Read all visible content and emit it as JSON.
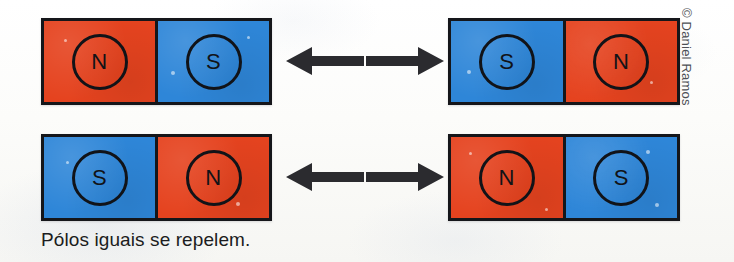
{
  "figure": {
    "caption": "Pólos iguais se repelem.",
    "credit": "© Daniel Ramos",
    "background_color": "#fbfbf9",
    "colors": {
      "north_pole": "#e5431f",
      "south_pole": "#2e86d8",
      "outline": "#15161a",
      "arrow": "#2b2b2f",
      "text": "#1b1c20",
      "credit_text": "#4c4f55"
    },
    "rows": [
      {
        "row_name": "top-pair",
        "left_magnet": {
          "name": "magnet-top-left",
          "poles": [
            {
              "label": "N",
              "type": "north",
              "icon": "north-pole-badge"
            },
            {
              "label": "S",
              "type": "south",
              "icon": "south-pole-badge"
            }
          ]
        },
        "left_arrow": {
          "name": "arrow-top-left",
          "direction": "left",
          "icon": "arrow-left-icon",
          "meaning": "repulsion"
        },
        "right_arrow": {
          "name": "arrow-top-right",
          "direction": "right",
          "icon": "arrow-right-icon",
          "meaning": "repulsion"
        },
        "right_magnet": {
          "name": "magnet-top-right",
          "poles": [
            {
              "label": "S",
              "type": "south",
              "icon": "south-pole-badge"
            },
            {
              "label": "N",
              "type": "north",
              "icon": "north-pole-badge"
            }
          ]
        }
      },
      {
        "row_name": "bottom-pair",
        "left_magnet": {
          "name": "magnet-bottom-left",
          "poles": [
            {
              "label": "S",
              "type": "south",
              "icon": "south-pole-badge"
            },
            {
              "label": "N",
              "type": "north",
              "icon": "north-pole-badge"
            }
          ]
        },
        "left_arrow": {
          "name": "arrow-bottom-left",
          "direction": "left",
          "icon": "arrow-left-icon",
          "meaning": "repulsion"
        },
        "right_arrow": {
          "name": "arrow-bottom-right",
          "direction": "right",
          "icon": "arrow-right-icon",
          "meaning": "repulsion"
        },
        "right_magnet": {
          "name": "magnet-bottom-right",
          "poles": [
            {
              "label": "N",
              "type": "north",
              "icon": "north-pole-badge"
            },
            {
              "label": "S",
              "type": "south",
              "icon": "south-pole-badge"
            }
          ]
        }
      }
    ]
  }
}
